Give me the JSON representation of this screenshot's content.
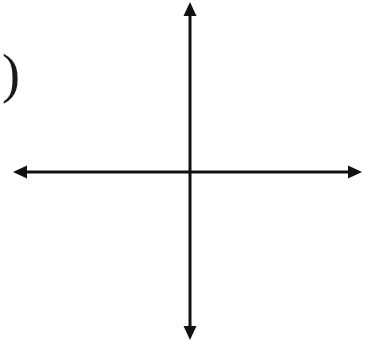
{
  "canvas": {
    "width": 372,
    "height": 346,
    "background_color": "#ffffff",
    "ink_color": "#111111"
  },
  "problem_marker": {
    "text": ")",
    "name": "problem-number-paren"
  },
  "chart_data": {
    "type": "scatter",
    "title": "",
    "subtitle": "",
    "xlabel": "",
    "ylabel": "",
    "grid": false,
    "legend": false,
    "legend_position": "none",
    "x": [],
    "y": [],
    "series": [],
    "xlim": [
      -9,
      8
    ],
    "ylim": [
      -8,
      8
    ],
    "x_tick_labels": [],
    "y_tick_labels": [],
    "annotations": [],
    "axes": {
      "origin_px": {
        "x": 190,
        "y": 172
      },
      "x_axis": {
        "name": "x-axis",
        "start_px": 13,
        "end_px": 362,
        "arrow_both_ends": true,
        "ticks_left_of_origin": 9,
        "ticks_right_of_origin": 8,
        "tick_spacing_px": 19.5,
        "tick_length_px": 12
      },
      "y_axis": {
        "name": "y-axis",
        "start_px": 2,
        "end_px": 340,
        "arrow_both_ends": true,
        "ticks_above_origin": 8,
        "ticks_below_origin": 8,
        "tick_spacing_px": 18.7,
        "tick_length_px": 12
      },
      "line_width_px": 3,
      "tick_width_px": 2.6,
      "arrow_half_width_px": 6.5,
      "arrow_length_px": 14
    }
  }
}
